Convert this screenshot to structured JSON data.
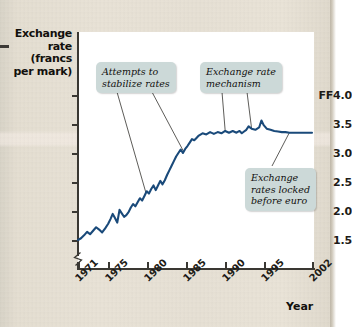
{
  "chart_data": {
    "type": "line",
    "title": "",
    "xlabel": "Year",
    "ylabel": "Exchange rate (francs per mark)",
    "ylabel_lines": [
      "Exchange",
      "rate",
      "(francs",
      "per mark)"
    ],
    "ylim": [
      1.35,
      4.0
    ],
    "xlim": [
      1971,
      2002
    ],
    "grid": false,
    "legend": "none",
    "axis_break": true,
    "series_name": "French francs per German mark",
    "line_color": "#1a4a7a",
    "y_ticks": [
      4.0,
      3.5,
      3.0,
      2.5,
      2.0,
      1.5
    ],
    "y_tick_labels": [
      "FF4.0",
      "3.5",
      "3.0",
      "2.5",
      "2.0",
      "1.5"
    ],
    "x_ticks": [
      1971,
      1975,
      1980,
      1985,
      1990,
      1995,
      2002
    ],
    "x_tick_labels": [
      "1971",
      "1975",
      "1980",
      "1985",
      "1990",
      "1995",
      "2002"
    ],
    "x": [
      1971.0,
      1971.4,
      1971.8,
      1972.2,
      1972.6,
      1973.0,
      1973.4,
      1973.8,
      1974.2,
      1974.6,
      1975.0,
      1975.3,
      1975.6,
      1975.9,
      1976.2,
      1976.5,
      1976.8,
      1977.1,
      1977.4,
      1977.7,
      1978.0,
      1978.3,
      1978.6,
      1978.9,
      1979.2,
      1979.5,
      1979.8,
      1980.1,
      1980.4,
      1980.7,
      1981.0,
      1981.3,
      1981.6,
      1981.9,
      1982.2,
      1982.5,
      1982.8,
      1983.1,
      1983.4,
      1983.7,
      1984.0,
      1984.3,
      1984.6,
      1984.9,
      1985.2,
      1985.5,
      1985.8,
      1986.1,
      1986.4,
      1986.7,
      1987.0,
      1987.5,
      1988.0,
      1988.5,
      1989.0,
      1989.5,
      1990.0,
      1990.5,
      1991.0,
      1991.5,
      1992.0,
      1992.4,
      1992.7,
      1993.0,
      1993.3,
      1993.6,
      1994.0,
      1994.5,
      1995.0,
      1995.3,
      1995.6,
      1996.0,
      1996.5,
      1997.0,
      1997.5,
      1998.0,
      1998.5,
      1999.0,
      2000.0,
      2001.0,
      2002.0
    ],
    "y": [
      1.5,
      1.53,
      1.58,
      1.64,
      1.6,
      1.66,
      1.72,
      1.68,
      1.63,
      1.7,
      1.78,
      1.86,
      1.95,
      1.88,
      1.8,
      2.02,
      1.96,
      1.9,
      1.93,
      1.98,
      2.06,
      2.12,
      2.08,
      2.15,
      2.22,
      2.18,
      2.26,
      2.34,
      2.3,
      2.38,
      2.44,
      2.36,
      2.44,
      2.52,
      2.46,
      2.53,
      2.62,
      2.7,
      2.78,
      2.86,
      2.94,
      3.0,
      3.06,
      3.0,
      3.07,
      3.12,
      3.18,
      3.24,
      3.22,
      3.26,
      3.3,
      3.34,
      3.32,
      3.36,
      3.33,
      3.36,
      3.34,
      3.38,
      3.35,
      3.38,
      3.35,
      3.38,
      3.34,
      3.37,
      3.4,
      3.46,
      3.42,
      3.4,
      3.44,
      3.56,
      3.48,
      3.42,
      3.4,
      3.38,
      3.37,
      3.36,
      3.36,
      3.35,
      3.35,
      3.35,
      3.35
    ],
    "annotations": [
      {
        "id": "attempts-to-stabilize-rates",
        "text": "Attempts to\nstabilize rates",
        "pointer_years": [
          1980.0,
          1985.0
        ]
      },
      {
        "id": "exchange-rate-mechanism",
        "text": "Exchange rate\nmechanism",
        "pointer_years": [
          1990.5,
          1994.0
        ]
      },
      {
        "id": "exchange-rates-locked-before-euro",
        "text": "Exchange\nrates locked\nbefore euro",
        "pointer_years": [
          1999.0
        ]
      }
    ]
  },
  "figure": {
    "ylabel_lines": [
      "Exchange",
      "rate",
      "(francs",
      "per mark)"
    ],
    "xlabel": "Year"
  }
}
